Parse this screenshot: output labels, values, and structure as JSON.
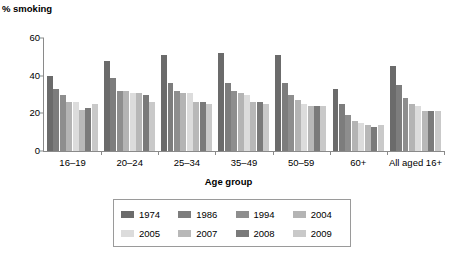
{
  "chart_data": {
    "type": "bar",
    "title": "",
    "ylabel": "% smoking",
    "xlabel": "Age group",
    "ylim": [
      0,
      60
    ],
    "yticks": [
      0,
      20,
      40,
      60
    ],
    "grid": false,
    "legend_position": "bottom",
    "categories": [
      "16–19",
      "20–24",
      "25–34",
      "35–49",
      "50–59",
      "60+",
      "All aged 16+"
    ],
    "series": [
      {
        "name": "1974",
        "color": "#6b6b6b",
        "values": [
          40,
          48,
          51,
          52,
          51,
          33,
          45
        ]
      },
      {
        "name": "1986",
        "color": "#7d7d7d",
        "values": [
          33,
          39,
          36,
          36,
          36,
          25,
          35
        ]
      },
      {
        "name": "1994",
        "color": "#8e8e8e",
        "values": [
          30,
          32,
          32,
          32,
          30,
          19,
          28
        ]
      },
      {
        "name": "2004",
        "color": "#b4b4b4",
        "values": [
          26,
          32,
          31,
          31,
          27,
          16,
          25
        ]
      },
      {
        "name": "2005",
        "color": "#dcdcdc",
        "values": [
          26,
          31,
          31,
          30,
          25,
          15,
          24
        ]
      },
      {
        "name": "2007",
        "color": "#b8b8b8",
        "values": [
          22,
          31,
          26,
          26,
          24,
          14,
          21
        ]
      },
      {
        "name": "2008",
        "color": "#7a7a7a",
        "values": [
          23,
          30,
          26,
          26,
          24,
          13,
          21
        ]
      },
      {
        "name": "2009",
        "color": "#c9c9c9",
        "values": [
          25,
          26,
          25,
          25,
          24,
          14,
          21
        ]
      }
    ]
  },
  "legend": {
    "rows": [
      [
        "1974",
        "1986",
        "1994",
        "2004"
      ],
      [
        "2005",
        "2007",
        "2008",
        "2009"
      ]
    ]
  }
}
